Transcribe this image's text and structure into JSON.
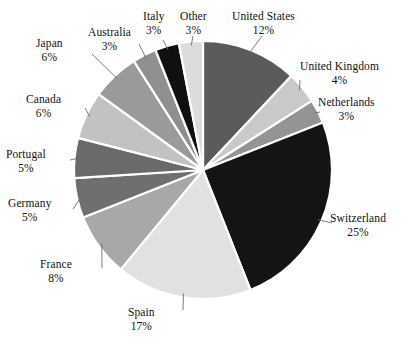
{
  "chart_data": {
    "type": "pie",
    "title": "",
    "xlabel": "",
    "ylabel": "",
    "legend_position": "none",
    "grid": false,
    "units": "percent",
    "total": 100,
    "start_angle_deg": 0,
    "direction": "clockwise",
    "categories": [
      "United States",
      "United Kingdom",
      "Netherlands",
      "Switzerland",
      "Spain",
      "France",
      "Germany",
      "Portugal",
      "Canada",
      "Japan",
      "Australia",
      "Italy",
      "Other"
    ],
    "values": [
      12,
      4,
      3,
      25,
      17,
      8,
      5,
      5,
      6,
      6,
      3,
      3,
      3
    ],
    "slices": [
      {
        "label": "United States",
        "value": 12,
        "value_text": "12%",
        "color": "#5b5b5b"
      },
      {
        "label": "United Kingdom",
        "value": 4,
        "value_text": "4%",
        "color": "#c9c9c9"
      },
      {
        "label": "Netherlands",
        "value": 3,
        "value_text": "3%",
        "color": "#949494"
      },
      {
        "label": "Switzerland",
        "value": 25,
        "value_text": "25%",
        "color": "#141414"
      },
      {
        "label": "Spain",
        "value": 17,
        "value_text": "17%",
        "color": "#e1e1e1"
      },
      {
        "label": "France",
        "value": 8,
        "value_text": "8%",
        "color": "#a8a8a8"
      },
      {
        "label": "Germany",
        "value": 5,
        "value_text": "5%",
        "color": "#6f6f6f"
      },
      {
        "label": "Portugal",
        "value": 5,
        "value_text": "5%",
        "color": "#6a6a6a"
      },
      {
        "label": "Canada",
        "value": 6,
        "value_text": "6%",
        "color": "#c2c2c2"
      },
      {
        "label": "Japan",
        "value": 6,
        "value_text": "6%",
        "color": "#9a9a9a"
      },
      {
        "label": "Australia",
        "value": 3,
        "value_text": "3%",
        "color": "#8f8f8f"
      },
      {
        "label": "Italy",
        "value": 3,
        "value_text": "3%",
        "color": "#101010"
      },
      {
        "label": "Other",
        "value": 3,
        "value_text": "3%",
        "color": "#dcdcdc"
      }
    ]
  },
  "style": {
    "background": "#ffffff",
    "separator_color": "#ffffff",
    "leader_color": "#6d6d6d",
    "text_color": "#111111"
  },
  "geometry": {
    "center_x": 203,
    "center_y": 170,
    "radius": 129
  },
  "labels": {
    "united_states": {
      "name": "United States",
      "value": "12%"
    },
    "united_kingdom": {
      "name": "United Kingdom",
      "value": "4%"
    },
    "netherlands": {
      "name": "Netherlands",
      "value": "3%"
    },
    "switzerland": {
      "name": "Switzerland",
      "value": "25%"
    },
    "spain": {
      "name": "Spain",
      "value": "17%"
    },
    "france": {
      "name": "France",
      "value": "8%"
    },
    "germany": {
      "name": "Germany",
      "value": "5%"
    },
    "portugal": {
      "name": "Portugal",
      "value": "5%"
    },
    "canada": {
      "name": "Canada",
      "value": "6%"
    },
    "japan": {
      "name": "Japan",
      "value": "6%"
    },
    "australia": {
      "name": "Australia",
      "value": "3%"
    },
    "italy": {
      "name": "Italy",
      "value": "3%"
    },
    "other": {
      "name": "Other",
      "value": "3%"
    }
  }
}
